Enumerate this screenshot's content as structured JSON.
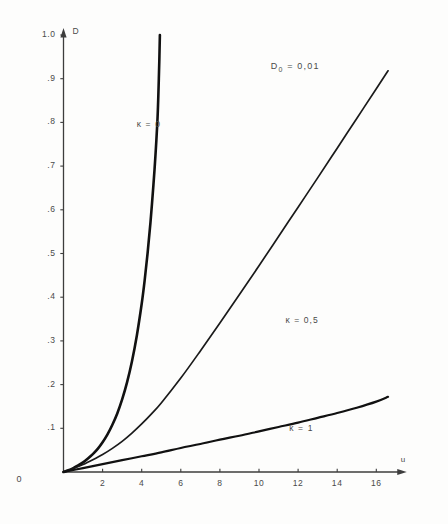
{
  "chart_data": {
    "type": "line",
    "title": "",
    "subtitle": "",
    "xlabel": "u",
    "ylabel": "D",
    "xlim": [
      0,
      17.2
    ],
    "ylim": [
      0,
      1.03
    ],
    "grid": false,
    "legend_position": "inline-curve-labels",
    "x_ticks": [
      2,
      4,
      6,
      8,
      10,
      12,
      14,
      16
    ],
    "x_tick_labels": [
      "2",
      "4",
      "6",
      "8",
      "10",
      "12",
      "14",
      "16"
    ],
    "y_ticks": [
      0.1,
      0.2,
      0.3,
      0.4,
      0.5,
      0.6,
      0.7,
      0.8,
      0.9,
      1.0
    ],
    "y_tick_labels": [
      ".1",
      ".2",
      ".3",
      ".4",
      ".5",
      ".6",
      ".7",
      ".8",
      ".9",
      "1.0"
    ],
    "origin_label": "0",
    "annotations": [
      {
        "name": "parameter-annotation",
        "text": "D",
        "subscript": "0",
        "suffix": " = 0,01",
        "full_text": "D0 = 0,01",
        "x": 10.6,
        "y": 0.925
      }
    ],
    "series": [
      {
        "name": "kappa-0",
        "label": "κ = 0",
        "label_x": 3.75,
        "label_y": 0.795,
        "line_width": 2.6,
        "color": "#111111",
        "x": [
          0,
          0.25,
          0.5,
          0.75,
          1.0,
          1.25,
          1.5,
          1.75,
          2.0,
          2.25,
          2.5,
          2.75,
          3.0,
          3.25,
          3.5,
          3.75,
          4.0,
          4.15,
          4.3,
          4.45,
          4.6,
          4.7,
          4.8,
          4.85,
          4.9,
          4.93
        ],
        "y": [
          0.0,
          0.004,
          0.009,
          0.015,
          0.022,
          0.031,
          0.041,
          0.053,
          0.068,
          0.086,
          0.108,
          0.134,
          0.166,
          0.205,
          0.253,
          0.312,
          0.385,
          0.438,
          0.5,
          0.572,
          0.657,
          0.722,
          0.8,
          0.86,
          0.94,
          1.0
        ]
      },
      {
        "name": "kappa-05",
        "label": "κ = 0,5",
        "label_x": 11.35,
        "label_y": 0.345,
        "line_width": 1.7,
        "color": "#1a1a1a",
        "x": [
          0,
          0.5,
          1.0,
          1.5,
          2.0,
          2.5,
          3.0,
          3.5,
          4.0,
          4.5,
          5.0,
          6.0,
          7.0,
          8.0,
          9.0,
          10.0,
          11.0,
          12.0,
          13.0,
          14.0,
          15.0,
          16.0,
          16.6
        ],
        "y": [
          0.0,
          0.008,
          0.017,
          0.028,
          0.04,
          0.054,
          0.07,
          0.089,
          0.11,
          0.133,
          0.158,
          0.215,
          0.277,
          0.341,
          0.406,
          0.472,
          0.539,
          0.606,
          0.673,
          0.741,
          0.809,
          0.877,
          0.918
        ]
      },
      {
        "name": "kappa-1",
        "label": "κ = 1",
        "label_x": 11.55,
        "label_y": 0.098,
        "line_width": 2.2,
        "color": "#111111",
        "x": [
          0,
          1.0,
          2.0,
          3.0,
          4.0,
          5.0,
          6.0,
          7.0,
          8.0,
          9.0,
          10.0,
          11.0,
          12.0,
          13.0,
          14.0,
          15.0,
          16.0,
          16.6
        ],
        "y": [
          0.0,
          0.009,
          0.018,
          0.027,
          0.036,
          0.045,
          0.055,
          0.064,
          0.074,
          0.083,
          0.093,
          0.103,
          0.113,
          0.124,
          0.135,
          0.147,
          0.161,
          0.172
        ]
      }
    ]
  },
  "colors": {
    "ink": "#1a1a1a",
    "axis": "#3d3d3d",
    "text": "#4a4a4a",
    "background": "#fdfdfc"
  }
}
